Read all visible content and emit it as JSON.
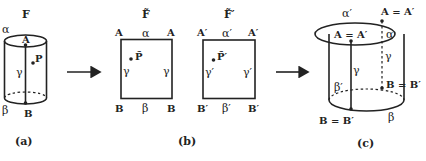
{
  "panels": {
    "a": {
      "caption": "(a)",
      "title": "F",
      "top_curve": "α",
      "bottom_curve": "β",
      "seam": "γ",
      "point_top": "A",
      "point_bottom": "B",
      "point_p": "P"
    },
    "b": {
      "caption": "(b)",
      "square1": {
        "title": "F̃",
        "top_left": "A",
        "top_right": "A",
        "top_edge": "α",
        "left_edge": "γ",
        "right_edge": "γ",
        "bottom_left": "B",
        "bottom_right": "B",
        "bottom_edge": "β",
        "point_p": "P̃"
      },
      "square2": {
        "title": "F̃′",
        "top_left": "A′",
        "top_right": "A′",
        "top_edge": "α′",
        "left_edge": "γ′",
        "right_edge": "γ′",
        "bottom_left": "B′",
        "bottom_right": "B′",
        "bottom_edge": "β′",
        "point_p": "P̃′"
      }
    },
    "c": {
      "caption": "(c)",
      "top_back_label": "α′",
      "top_front_label": "α",
      "back_top_point": "A = A′",
      "front_top_point": "A = A′",
      "front_seam": "γ",
      "back_seam": "γ",
      "back_bottom_label": "β′",
      "bottom_label": "β",
      "back_bottom_point": "B = B′",
      "front_bottom_point": "B = B′"
    }
  },
  "arrows": [
    "arrow-a-to-b",
    "arrow-b-to-c"
  ]
}
